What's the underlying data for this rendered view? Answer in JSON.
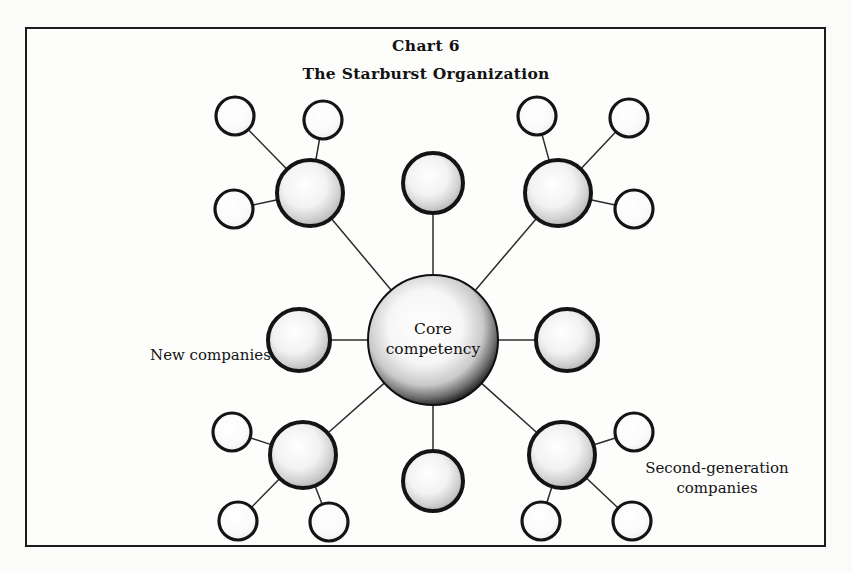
{
  "page": {
    "background_color": "#fbfbfa",
    "frame_color": "#1c1c1c"
  },
  "header": {
    "chart_number": "Chart 6",
    "title": "The Starburst Organization"
  },
  "labels": {
    "new_companies": "New companies",
    "second_generation_line1": "Second-generation",
    "second_generation_line2": "companies"
  },
  "hub": {
    "line1": "Core",
    "line2": "competency"
  },
  "chart_data": {
    "type": "diagram",
    "diagram_kind": "radial-hub-and-spoke (starburst)",
    "title": "The Starburst Organization",
    "subtitle": "Chart 6",
    "hub": {
      "id": "core",
      "label": "Core competency",
      "cx": 433,
      "cy": 340,
      "r": 65,
      "fill": "radial-gradient white-center to dark-edge",
      "stroke": "#111111"
    },
    "ring1_label": "New companies",
    "ring2_label": "Second-generation companies",
    "ring1_count": 8,
    "ring2_count": 12,
    "nodes": [
      {
        "id": "n-nw",
        "ring": 1,
        "cx": 310,
        "cy": 193,
        "r": 33,
        "has_children": true,
        "children": [
          {
            "id": "n-nw-a",
            "cx": 235,
            "cy": 116,
            "r": 19
          },
          {
            "id": "n-nw-b",
            "cx": 323,
            "cy": 120,
            "r": 19
          },
          {
            "id": "n-nw-c",
            "cx": 234,
            "cy": 209,
            "r": 19
          }
        ]
      },
      {
        "id": "n-n",
        "ring": 1,
        "cx": 433,
        "cy": 183,
        "r": 30,
        "has_children": false,
        "children": []
      },
      {
        "id": "n-ne",
        "ring": 1,
        "cx": 558,
        "cy": 193,
        "r": 33,
        "has_children": true,
        "children": [
          {
            "id": "n-ne-a",
            "cx": 537,
            "cy": 116,
            "r": 19
          },
          {
            "id": "n-ne-b",
            "cx": 629,
            "cy": 118,
            "r": 19
          },
          {
            "id": "n-ne-c",
            "cx": 634,
            "cy": 209,
            "r": 19
          }
        ]
      },
      {
        "id": "n-w",
        "ring": 1,
        "cx": 299,
        "cy": 340,
        "r": 31,
        "has_children": false,
        "children": []
      },
      {
        "id": "n-e",
        "ring": 1,
        "cx": 567,
        "cy": 340,
        "r": 31,
        "has_children": false,
        "children": []
      },
      {
        "id": "n-sw",
        "ring": 1,
        "cx": 303,
        "cy": 455,
        "r": 33,
        "has_children": true,
        "children": [
          {
            "id": "n-sw-a",
            "cx": 232,
            "cy": 432,
            "r": 19
          },
          {
            "id": "n-sw-b",
            "cx": 238,
            "cy": 521,
            "r": 19
          },
          {
            "id": "n-sw-c",
            "cx": 329,
            "cy": 522,
            "r": 19
          }
        ]
      },
      {
        "id": "n-s",
        "ring": 1,
        "cx": 433,
        "cy": 481,
        "r": 30,
        "has_children": false,
        "children": []
      },
      {
        "id": "n-se",
        "ring": 1,
        "cx": 562,
        "cy": 455,
        "r": 33,
        "has_children": true,
        "children": [
          {
            "id": "n-se-a",
            "cx": 634,
            "cy": 432,
            "r": 19
          },
          {
            "id": "n-se-b",
            "cx": 541,
            "cy": 521,
            "r": 19
          },
          {
            "id": "n-se-c",
            "cx": 632,
            "cy": 521,
            "r": 19
          }
        ]
      }
    ],
    "edges": [
      {
        "from": "core",
        "to": "n-nw"
      },
      {
        "from": "core",
        "to": "n-n"
      },
      {
        "from": "core",
        "to": "n-ne"
      },
      {
        "from": "core",
        "to": "n-w"
      },
      {
        "from": "core",
        "to": "n-e"
      },
      {
        "from": "core",
        "to": "n-sw"
      },
      {
        "from": "core",
        "to": "n-s"
      },
      {
        "from": "core",
        "to": "n-se"
      },
      {
        "from": "n-nw",
        "to": "n-nw-a"
      },
      {
        "from": "n-nw",
        "to": "n-nw-b"
      },
      {
        "from": "n-nw",
        "to": "n-nw-c"
      },
      {
        "from": "n-ne",
        "to": "n-ne-a"
      },
      {
        "from": "n-ne",
        "to": "n-ne-b"
      },
      {
        "from": "n-ne",
        "to": "n-ne-c"
      },
      {
        "from": "n-sw",
        "to": "n-sw-a"
      },
      {
        "from": "n-sw",
        "to": "n-sw-b"
      },
      {
        "from": "n-sw",
        "to": "n-sw-c"
      },
      {
        "from": "n-se",
        "to": "n-se-a"
      },
      {
        "from": "n-se",
        "to": "n-se-b"
      },
      {
        "from": "n-se",
        "to": "n-se-c"
      }
    ],
    "colors": {
      "ink": "#111111",
      "edge": "#2a2a2a",
      "node_fill_light": "#ffffff",
      "node_fill_shade": "#d9d9d9",
      "paper": "#fdfdfc"
    }
  }
}
